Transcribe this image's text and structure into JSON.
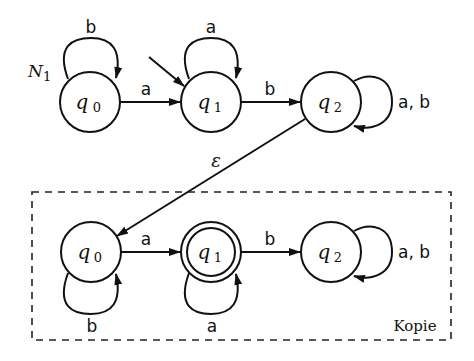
{
  "diagram": {
    "automaton_name": "N",
    "automaton_name_sub": "1",
    "copy_box_label": "Kopie",
    "epsilon_label": "ε",
    "colors": {
      "stroke": "#111111",
      "background": "#ffffff"
    },
    "top_row": {
      "states": [
        {
          "id": "q0",
          "base": "q",
          "sub": "0",
          "start": false,
          "accepting": false
        },
        {
          "id": "q1",
          "base": "q",
          "sub": "1",
          "start": true,
          "accepting": false
        },
        {
          "id": "q2",
          "base": "q",
          "sub": "2",
          "start": false,
          "accepting": false
        }
      ],
      "transitions": [
        {
          "from": "q0",
          "to": "q0",
          "label": "b"
        },
        {
          "from": "q0",
          "to": "q1",
          "label": "a"
        },
        {
          "from": "q1",
          "to": "q1",
          "label": "a"
        },
        {
          "from": "q1",
          "to": "q2",
          "label": "b"
        },
        {
          "from": "q2",
          "to": "q2",
          "label": "a, b"
        }
      ]
    },
    "bottom_row": {
      "states": [
        {
          "id": "q0",
          "base": "q",
          "sub": "0",
          "start": false,
          "accepting": false
        },
        {
          "id": "q1",
          "base": "q",
          "sub": "1",
          "start": false,
          "accepting": true
        },
        {
          "id": "q2",
          "base": "q",
          "sub": "2",
          "start": false,
          "accepting": false
        }
      ],
      "transitions": [
        {
          "from": "q0",
          "to": "q0",
          "label": "b"
        },
        {
          "from": "q0",
          "to": "q1",
          "label": "a"
        },
        {
          "from": "q1",
          "to": "q1",
          "label": "a"
        },
        {
          "from": "q1",
          "to": "q2",
          "label": "b"
        },
        {
          "from": "q2",
          "to": "q2",
          "label": "a, b"
        }
      ]
    },
    "cross_transitions": [
      {
        "from": "top.q2",
        "to": "bottom.q0",
        "label": "ε"
      }
    ]
  }
}
